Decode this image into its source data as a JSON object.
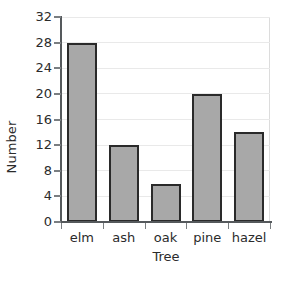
{
  "chart_data": {
    "type": "bar",
    "title": "",
    "xlabel": "Tree",
    "ylabel": "Number",
    "categories": [
      "elm",
      "ash",
      "oak",
      "pine",
      "hazel"
    ],
    "values": [
      28,
      12,
      6,
      20,
      14
    ],
    "ylim": [
      0,
      32
    ],
    "ytick_step": 4,
    "yticks": [
      0,
      4,
      8,
      12,
      16,
      20,
      24,
      28,
      32
    ],
    "ytick_labels": [
      "0",
      "4",
      "8",
      "12",
      "16",
      "20",
      "24",
      "28",
      "32"
    ],
    "grid": true,
    "grid_axis": "y",
    "legend": false,
    "legend_position": "none",
    "bar_fill_color": "#a8a8a8",
    "bar_edge_color": "#2a2a2a",
    "gridline_color": "#e9e9e9",
    "axis_color": "#55595c",
    "text_color": "#2b2b2b",
    "background_color": "#ffffff"
  }
}
